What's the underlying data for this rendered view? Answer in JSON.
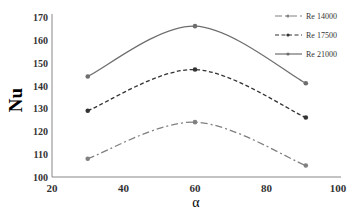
{
  "chart_data": {
    "type": "line",
    "title": "",
    "xlabel": "α",
    "ylabel": "Nu",
    "xlim": [
      20,
      100
    ],
    "ylim": [
      100,
      170
    ],
    "xticks": [
      20,
      40,
      60,
      80,
      100
    ],
    "yticks": [
      100,
      110,
      120,
      130,
      140,
      150,
      160,
      170
    ],
    "grid": false,
    "legend_position": "top-right",
    "x": [
      30,
      60,
      91
    ],
    "series": [
      {
        "name": "Re 14000",
        "values": [
          108,
          124,
          105
        ],
        "style": "dash-dot",
        "color": "#808080"
      },
      {
        "name": "Re 17500",
        "values": [
          129,
          147,
          126
        ],
        "style": "dashed",
        "color": "#333333"
      },
      {
        "name": "Re 21000",
        "values": [
          144,
          166,
          141
        ],
        "style": "solid",
        "color": "#6e6e6e"
      }
    ]
  }
}
